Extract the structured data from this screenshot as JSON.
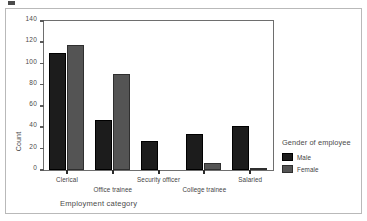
{
  "chart_data": {
    "type": "bar",
    "title": "",
    "categories": [
      "Clerical",
      "Office trainee",
      "Security officer",
      "College trainee",
      "Salaried"
    ],
    "series": [
      {
        "name": "Male",
        "values": [
          110,
          47,
          27,
          34,
          41
        ],
        "color": "#1c1c1c"
      },
      {
        "name": "Female",
        "values": [
          117,
          90,
          0,
          7,
          2
        ],
        "color": "#545454"
      }
    ],
    "xlabel": "Employment category",
    "ylabel": "Count",
    "ylim": [
      0,
      140
    ],
    "yticks": [
      0,
      20,
      40,
      60,
      80,
      100,
      120,
      140
    ],
    "ytick_labels": [
      "0",
      "20",
      "40",
      "60",
      "80",
      "100",
      "120",
      "140"
    ],
    "grid": false,
    "legend": {
      "title": "Gender of employee",
      "position": "right",
      "entries": [
        {
          "label": "Male",
          "color": "#1c1c1c"
        },
        {
          "label": "Female",
          "color": "#545454"
        }
      ]
    }
  }
}
